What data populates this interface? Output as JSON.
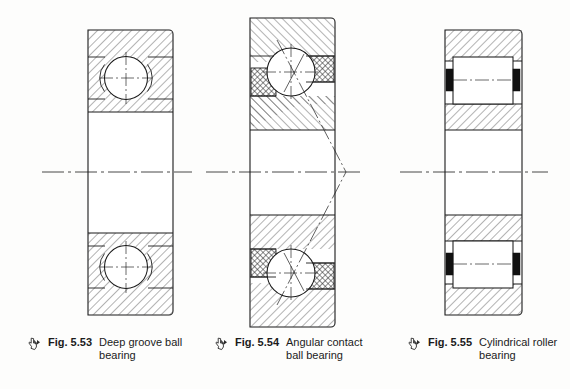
{
  "page": {
    "background_color": "#fdfdfc",
    "line_color": "#1b1b1b",
    "hatch_color": "#4a4a4a",
    "width": 570,
    "height": 389
  },
  "figures": [
    {
      "id": "fig-5-53",
      "fig_label": "Fig. 5.53",
      "title_line1": "Deep groove",
      "title_line2": "ball bearing",
      "title_full": "Deep groove ball bearing",
      "glyph": "pointer-hand-icon",
      "type": "deep-groove-ball-bearing",
      "geometry": {
        "left": 88,
        "right": 173,
        "top": 30,
        "bottom": 315,
        "centerline_y": 172,
        "outer_ring_thickness": 26,
        "ball_diameter": 42,
        "ball_top_center_y": 78,
        "ball_bottom_center_y": 267,
        "ring_corner_radius": 4
      },
      "elements": [
        "outer-ring",
        "inner-ring",
        "ball",
        "raceway-groove",
        "centerline",
        "ball-crosshair"
      ]
    },
    {
      "id": "fig-5-54",
      "fig_label": "Fig. 5.54",
      "title_line1": "Angular contact",
      "title_line2": "ball bearing",
      "title_full": "Angular contact ball bearing",
      "glyph": "pointer-hand-icon",
      "type": "angular-contact-ball-bearing",
      "geometry": {
        "left": 250,
        "right": 335,
        "top": 18,
        "bottom": 327,
        "centerline_y": 172,
        "ball_diameter": 48,
        "ball_top_center_y": 72,
        "ball_bottom_center_y": 273,
        "contact_apex_x": 346,
        "contact_angle_deg": 40
      },
      "elements": [
        "outer-ring",
        "inner-ring",
        "ball",
        "cage-block",
        "contact-angle-line",
        "centerline",
        "ball-crosshair"
      ]
    },
    {
      "id": "fig-5-55",
      "fig_label": "Fig. 5.55",
      "title_line1": "Cylindrical",
      "title_line2": "roller bearing",
      "title_full": "Cylindrical roller bearing",
      "glyph": "pointer-hand-icon",
      "type": "cylindrical-roller-bearing",
      "geometry": {
        "left": 445,
        "right": 522,
        "top": 30,
        "bottom": 315,
        "centerline_y": 172,
        "roller_top_y": 57,
        "roller_bottom_y": 254,
        "roller_width": 60,
        "roller_height": 42,
        "flange_bar_width": 7,
        "flange_bar_height": 22
      },
      "elements": [
        "outer-ring",
        "inner-ring",
        "roller",
        "flange-bar",
        "centerline",
        "roller-axis"
      ]
    }
  ]
}
